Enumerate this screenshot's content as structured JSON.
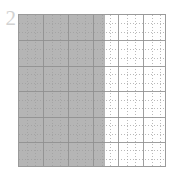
{
  "figure": {
    "background_color": "#ffffff",
    "width_px": 176,
    "height_px": 185
  },
  "axis": {
    "tick_label_visible": "2",
    "tick_label_color": "#d2d2d2",
    "border_color": "#9a9a9a"
  },
  "chart_data": {
    "type": "area",
    "title": "",
    "subtitle": "",
    "xlabel": "",
    "ylabel": "",
    "xlim": [
      0,
      6
    ],
    "ylim": [
      0,
      6
    ],
    "grid": true,
    "minor_grid": true,
    "legend": false,
    "legend_position": "none",
    "xticks": [
      0,
      1,
      2,
      3,
      4,
      5,
      6
    ],
    "yticks": [
      0,
      1,
      2,
      3,
      4,
      5,
      6
    ],
    "xticklabels": [
      "",
      "",
      "",
      "",
      "",
      "",
      ""
    ],
    "yticklabels": [
      "",
      "",
      "",
      "",
      "2",
      "",
      ""
    ],
    "series": [
      {
        "name": "shaded-region",
        "kind": "vertical-span",
        "x_start": 0,
        "x_end": 3.56,
        "y_start": 0,
        "y_end": 6,
        "fill_color": "#b5b5b5",
        "fill_fraction_of_width": 0.59
      }
    ],
    "annotations": []
  },
  "grid": {
    "major_color": "#8e8e8e",
    "minor_color": "#9c9c9c",
    "major_count_vertical": 6,
    "major_count_horizontal": 6,
    "minor_per_major": 2
  },
  "plot_area": {
    "left_px": 18,
    "top_px": 14,
    "width_px": 148,
    "height_px": 153
  },
  "shading": {
    "color": "#b5b5b5",
    "width_px": 87
  }
}
